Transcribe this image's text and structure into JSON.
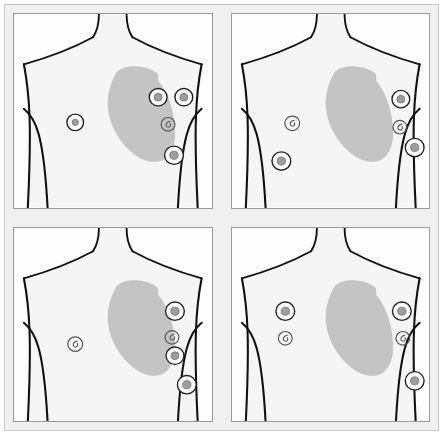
{
  "figure": {
    "title": "",
    "panel_count": 4,
    "background_color": "#ffffff",
    "frame_fill": "#f0f0f0",
    "frame_border": "#c9c9c9",
    "panel_fill": "#fdfdfd",
    "panel_border": "#9a9a9a",
    "torso_fill": "#f5f5f5",
    "torso_outline": "#111111",
    "heart_fill": "#c4c4c4",
    "electrode_ring_stroke": "#222222",
    "electrode_core_fill": "#9d9d9d",
    "electrode_small_stroke": "#555555"
  },
  "panels": [
    {
      "id": "panel-top-left",
      "label": "A",
      "heart": {
        "path": "M 104 60 C 98 70 94 84 95 96 C 96 112 104 128 116 140 C 128 152 142 156 152 150 C 161 144 164 132 163 118 C 162 102 158 88 152 78 C 150 74 148 71 146 69 L 146 62 C 140 57 132 54 122 54 C 114 54 108 56 104 60 Z"
      },
      "electrodes": [
        {
          "name": "electrode-v1",
          "type": "large",
          "cx": 62,
          "cy": 112,
          "r": 8.5,
          "core_r": 3.2
        },
        {
          "name": "electrode-v2",
          "type": "large",
          "cx": 146,
          "cy": 86,
          "r": 9.0,
          "core_r": 4.0
        },
        {
          "name": "electrode-v3",
          "type": "large",
          "cx": 172,
          "cy": 86,
          "r": 9.0,
          "core_r": 4.0
        },
        {
          "name": "electrode-v4",
          "type": "small",
          "cx": 156,
          "cy": 114,
          "r": 7.0,
          "core_r": 0
        },
        {
          "name": "electrode-v5",
          "type": "large",
          "cx": 162,
          "cy": 146,
          "r": 9.5,
          "core_r": 4.2
        }
      ]
    },
    {
      "id": "panel-top-right",
      "label": "B",
      "heart": {
        "path": "M 104 60 C 98 70 94 84 95 96 C 96 112 104 128 116 140 C 128 152 142 156 152 150 C 161 144 164 132 163 118 C 162 102 158 88 152 78 C 150 74 148 71 146 69 L 146 62 C 140 57 132 54 122 54 C 114 54 108 56 104 60 Z"
      },
      "electrodes": [
        {
          "name": "electrode-v1",
          "type": "small",
          "cx": 61,
          "cy": 113,
          "r": 7.5,
          "core_r": 0
        },
        {
          "name": "electrode-v2",
          "type": "large",
          "cx": 171,
          "cy": 88,
          "r": 9.0,
          "core_r": 4.0
        },
        {
          "name": "electrode-v3",
          "type": "small",
          "cx": 170,
          "cy": 117,
          "r": 7.0,
          "core_r": 0
        },
        {
          "name": "electrode-v4",
          "type": "large",
          "cx": 50,
          "cy": 152,
          "r": 9.5,
          "core_r": 4.2
        },
        {
          "name": "electrode-v5",
          "type": "large",
          "cx": 185,
          "cy": 138,
          "r": 9.5,
          "core_r": 4.2
        }
      ]
    },
    {
      "id": "panel-bottom-left",
      "label": "C",
      "heart": {
        "path": "M 104 60 C 98 70 94 84 95 96 C 96 112 104 128 116 140 C 128 152 142 156 152 150 C 161 144 164 132 163 118 C 162 102 158 88 152 78 C 150 74 148 71 146 69 L 146 62 C 140 57 132 54 122 54 C 114 54 108 56 104 60 Z"
      },
      "electrodes": [
        {
          "name": "electrode-v1",
          "type": "small",
          "cx": 62,
          "cy": 120,
          "r": 7.5,
          "core_r": 0
        },
        {
          "name": "electrode-v2",
          "type": "large",
          "cx": 163,
          "cy": 86,
          "r": 9.5,
          "core_r": 4.2
        },
        {
          "name": "electrode-v3",
          "type": "small",
          "cx": 160,
          "cy": 113,
          "r": 7.0,
          "core_r": 0
        },
        {
          "name": "electrode-v4",
          "type": "large",
          "cx": 163,
          "cy": 132,
          "r": 9.0,
          "core_r": 4.0
        },
        {
          "name": "electrode-v5",
          "type": "large",
          "cx": 175,
          "cy": 162,
          "r": 9.5,
          "core_r": 4.2
        }
      ]
    },
    {
      "id": "panel-bottom-right",
      "label": "D",
      "heart": {
        "path": "M 104 60 C 98 70 94 84 95 96 C 96 112 104 128 116 140 C 128 152 142 156 152 150 C 161 144 164 132 163 118 C 162 102 158 88 152 78 C 150 74 148 71 146 69 L 146 62 C 140 57 132 54 122 54 C 114 54 108 56 104 60 Z"
      },
      "electrodes": [
        {
          "name": "electrode-v1",
          "type": "large",
          "cx": 54,
          "cy": 86,
          "r": 9.5,
          "core_r": 4.2
        },
        {
          "name": "electrode-v2",
          "type": "small",
          "cx": 54,
          "cy": 114,
          "r": 7.0,
          "core_r": 0
        },
        {
          "name": "electrode-v3",
          "type": "large",
          "cx": 172,
          "cy": 86,
          "r": 9.5,
          "core_r": 4.2
        },
        {
          "name": "electrode-v4",
          "type": "small",
          "cx": 173,
          "cy": 114,
          "r": 7.0,
          "core_r": 0
        },
        {
          "name": "electrode-v5",
          "type": "large",
          "cx": 185,
          "cy": 158,
          "r": 9.5,
          "core_r": 4.2
        }
      ]
    }
  ],
  "torso": {
    "body_path": "M 0 0 L 200 0 L 200 200 L 0 200 Z",
    "neck_left": "M 86 0 C 86 10 84 18 80 24",
    "neck_right": "M 114 0 C 114 10 116 18 120 24",
    "shoulder_left": "M 80 24 C 62 34 38 44 10 52",
    "shoulder_right": "M 120 24 C 138 34 162 44 190 52",
    "arm_left_outer": "M 10 52 C 16 84 18 116 14 200",
    "arm_right_outer": "M 190 52 C 184 84 182 116 186 200",
    "armpit_left": "M 10 98 C 22 108 30 124 34 200",
    "armpit_right": "M 190 98 C 178 108 170 124 166 200"
  }
}
